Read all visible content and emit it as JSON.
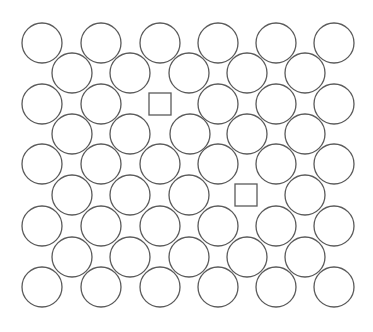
{
  "diagram": {
    "title": "",
    "stroke_color": "#5a5a5a",
    "background": "#ffffff",
    "circle_radius": 20,
    "square_size": 22,
    "rows": [
      {
        "y": 43,
        "shapes": [
          {
            "x": 42,
            "t": "c"
          },
          {
            "x": 101,
            "t": "c"
          },
          {
            "x": 160,
            "t": "c"
          },
          {
            "x": 218,
            "t": "c"
          },
          {
            "x": 276,
            "t": "c"
          },
          {
            "x": 334,
            "t": "c"
          }
        ]
      },
      {
        "y": 73,
        "shapes": [
          {
            "x": 72,
            "t": "c"
          },
          {
            "x": 130,
            "t": "c"
          },
          {
            "x": 189,
            "t": "c"
          },
          {
            "x": 247,
            "t": "c"
          },
          {
            "x": 305,
            "t": "c"
          }
        ]
      },
      {
        "y": 104,
        "shapes": [
          {
            "x": 42,
            "t": "c"
          },
          {
            "x": 101,
            "t": "c"
          },
          {
            "x": 160,
            "t": "s"
          },
          {
            "x": 218,
            "t": "c"
          },
          {
            "x": 276,
            "t": "c"
          },
          {
            "x": 334,
            "t": "c"
          }
        ]
      },
      {
        "y": 134,
        "shapes": [
          {
            "x": 72,
            "t": "c"
          },
          {
            "x": 130,
            "t": "c"
          },
          {
            "x": 190,
            "t": "c"
          },
          {
            "x": 247,
            "t": "c"
          },
          {
            "x": 305,
            "t": "c"
          }
        ]
      },
      {
        "y": 164,
        "shapes": [
          {
            "x": 42,
            "t": "c"
          },
          {
            "x": 101,
            "t": "c"
          },
          {
            "x": 160,
            "t": "c"
          },
          {
            "x": 218,
            "t": "c"
          },
          {
            "x": 276,
            "t": "c"
          },
          {
            "x": 334,
            "t": "c"
          }
        ]
      },
      {
        "y": 195,
        "shapes": [
          {
            "x": 72,
            "t": "c"
          },
          {
            "x": 130,
            "t": "c"
          },
          {
            "x": 189,
            "t": "c"
          },
          {
            "x": 246,
            "t": "s"
          },
          {
            "x": 305,
            "t": "c"
          }
        ]
      },
      {
        "y": 226,
        "shapes": [
          {
            "x": 42,
            "t": "c"
          },
          {
            "x": 101,
            "t": "c"
          },
          {
            "x": 160,
            "t": "c"
          },
          {
            "x": 218,
            "t": "c"
          },
          {
            "x": 276,
            "t": "c"
          },
          {
            "x": 334,
            "t": "c"
          }
        ]
      },
      {
        "y": 257,
        "shapes": [
          {
            "x": 72,
            "t": "c"
          },
          {
            "x": 130,
            "t": "c"
          },
          {
            "x": 189,
            "t": "c"
          },
          {
            "x": 247,
            "t": "c"
          },
          {
            "x": 305,
            "t": "c"
          }
        ]
      },
      {
        "y": 287,
        "shapes": [
          {
            "x": 42,
            "t": "c"
          },
          {
            "x": 101,
            "t": "c"
          },
          {
            "x": 160,
            "t": "c"
          },
          {
            "x": 218,
            "t": "c"
          },
          {
            "x": 276,
            "t": "c"
          },
          {
            "x": 334,
            "t": "c"
          }
        ]
      }
    ],
    "counts": {
      "circles": 47,
      "squares": 2
    }
  }
}
